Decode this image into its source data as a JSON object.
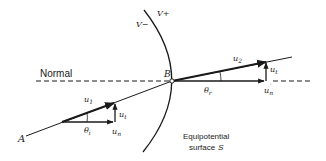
{
  "diagram": {
    "labels": {
      "normal": "Normal",
      "point_a": "A",
      "point_b": "B",
      "v_minus": "V−",
      "v_plus": "V+",
      "u1": "u",
      "u1_sub": "1",
      "u2": "u",
      "u2_sub": "2",
      "ut_left": "u",
      "ut_left_sub": "t",
      "ut_right": "u",
      "ut_right_sub": "t",
      "un": "u",
      "un_sub": "n",
      "un_prime": "u",
      "un_prime_sub": "n",
      "un_prime_mark": "′",
      "theta_i": "θ",
      "theta_i_sub": "i",
      "theta_r": "θ",
      "theta_r_sub": "r",
      "surface_line1": "Equipotential",
      "surface_line2": "surface",
      "surface_name": "S"
    },
    "colors": {
      "ink": "#1a1a1a",
      "background": "#ffffff"
    }
  }
}
